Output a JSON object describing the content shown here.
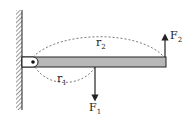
{
  "diagram": {
    "type": "lever-torque",
    "labels": {
      "F1": {
        "main": "F",
        "sub": "1"
      },
      "F2": {
        "main": "F",
        "sub": "2"
      },
      "r1": {
        "main": "r",
        "sub": "1"
      },
      "r2": {
        "main": "r",
        "sub": "2"
      }
    },
    "colors": {
      "beam_fill": "#b8b8b8",
      "stroke": "#222222",
      "background": "#ffffff"
    }
  }
}
